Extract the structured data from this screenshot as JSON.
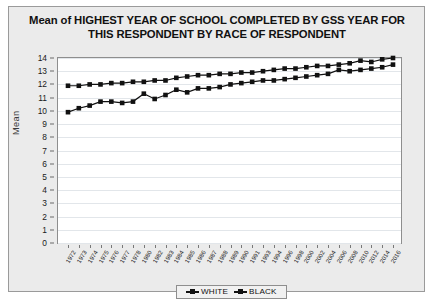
{
  "chart_data": {
    "type": "line",
    "title_line1": "Mean of HIGHEST YEAR OF SCHOOL COMPLETED BY GSS YEAR FOR",
    "title_line2": "THIS RESPONDENT BY RACE OF RESPONDENT",
    "xlabel": "",
    "ylabel": "Mean",
    "ylim": [
      0,
      14
    ],
    "ytick_labels": [
      "0",
      "1",
      "2",
      "3",
      "4",
      "5",
      "6",
      "7",
      "8",
      "9",
      "10",
      "11",
      "12",
      "13",
      "14"
    ],
    "ytick_values": [
      0,
      1,
      2,
      3,
      4,
      5,
      6,
      7,
      8,
      9,
      10,
      11,
      12,
      13,
      14
    ],
    "grid": true,
    "legend_position": "bottom-center",
    "marker": "square",
    "line_color": "#111111",
    "categories": [
      "1972",
      "1973",
      "1974",
      "1975",
      "1976",
      "1977",
      "1978",
      "1980",
      "1982",
      "1983",
      "1984",
      "1985",
      "1986",
      "1987",
      "1988",
      "1989",
      "1990",
      "1991",
      "1993",
      "1994",
      "1996",
      "1998",
      "2000",
      "2002",
      "2004",
      "2006",
      "2008",
      "2010",
      "2012",
      "2014",
      "2016"
    ],
    "x_tick_labels": [
      "1972",
      "1973",
      "1974",
      "1975",
      "1976",
      "1977",
      "1978",
      "1980",
      "1982",
      "1983",
      "1984",
      "1985",
      "1986",
      "1987",
      "1988",
      "1989",
      "1990",
      "1991",
      "1993",
      "1994",
      "1996",
      "1998",
      "2000",
      "2002",
      "2004",
      "2006",
      "2008",
      "2010",
      "2012",
      "2014",
      "2016"
    ],
    "series": [
      {
        "name": "WHITE",
        "color": "#111111",
        "values": [
          11.9,
          11.9,
          12.0,
          12.0,
          12.1,
          12.1,
          12.2,
          12.2,
          12.3,
          12.3,
          12.5,
          12.6,
          12.7,
          12.7,
          12.8,
          12.8,
          12.9,
          12.9,
          13.0,
          13.1,
          13.2,
          13.2,
          13.3,
          13.4,
          13.4,
          13.5,
          13.6,
          13.8,
          13.7,
          13.9,
          14.0
        ]
      },
      {
        "name": "BLACK",
        "color": "#111111",
        "values": [
          9.9,
          10.2,
          10.4,
          10.7,
          10.7,
          10.6,
          10.7,
          11.3,
          10.9,
          11.2,
          11.6,
          11.4,
          11.7,
          11.7,
          11.8,
          12.0,
          12.1,
          12.2,
          12.3,
          12.3,
          12.4,
          12.5,
          12.6,
          12.7,
          12.8,
          13.1,
          13.0,
          13.1,
          13.2,
          13.3,
          13.5
        ]
      }
    ]
  },
  "legend": {
    "entries": [
      {
        "label": "WHITE"
      },
      {
        "label": "BLACK"
      }
    ]
  }
}
